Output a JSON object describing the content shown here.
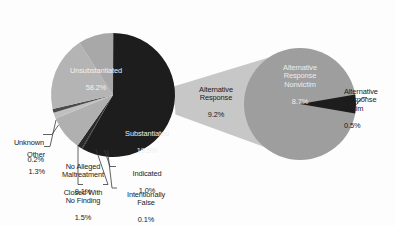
{
  "chart_data": {
    "type": "pie",
    "title": "",
    "subtitle": "",
    "xlabel": "",
    "ylabel": "",
    "legend_position": "none",
    "grid": false,
    "units": "percent",
    "total": 100.0,
    "categories": [
      "Unsubstantiated",
      "Alternative Response",
      "Substantiated",
      "Indicated",
      "Intentionally False",
      "Closed With No Finding",
      "No Alleged Maltreatment",
      "Other",
      "Unknown"
    ],
    "values": [
      58.2,
      9.2,
      19.5,
      1.0,
      0.1,
      1.5,
      9.1,
      1.3,
      0.2
    ],
    "series": [
      {
        "name": "Child maltreatment investigation dispositions",
        "values": [
          58.2,
          9.2,
          19.5,
          1.0,
          0.1,
          1.5,
          9.1,
          1.3,
          0.2
        ]
      }
    ],
    "secondary_pie": {
      "parent_category": "Alternative Response",
      "parent_value": 9.2,
      "categories": [
        "Alternative Response Nonvictim",
        "Alternative Response Victim"
      ],
      "values": [
        8.7,
        0.5
      ]
    }
  },
  "main_pie": {
    "slices": [
      {
        "key": "unsubstantiated",
        "name": "Unsubstantiated",
        "label": "Unsubstantiated",
        "value": "58.2%",
        "pct": 58.2,
        "color": "#1d1d1d",
        "label_placement": "inside"
      },
      {
        "key": "alternative-response",
        "name": "Alternative Response",
        "label": "Alternative Response",
        "value": "9.2%",
        "pct": 9.2,
        "color": "#a8a8a8",
        "label_placement": "callout"
      },
      {
        "key": "substantiated",
        "name": "Substantiated",
        "label": "Substantiated",
        "value": "19.5%",
        "pct": 19.5,
        "color": "#b4b4b4",
        "label_placement": "inside"
      },
      {
        "key": "indicated",
        "name": "Indicated",
        "label": "Indicated",
        "value": "1.0%",
        "pct": 1.0,
        "color": "#4a4a4a",
        "label_placement": "leader"
      },
      {
        "key": "intentionally-false",
        "name": "Intentionally False",
        "label": "Intentionally\nFalse",
        "value": "0.1%",
        "pct": 0.1,
        "color": "#9a9a9a",
        "label_placement": "leader"
      },
      {
        "key": "closed-with-no-finding",
        "name": "Closed With No Finding",
        "label": "Closed With\nNo Finding",
        "value": "1.5%",
        "pct": 1.5,
        "color": "#c0c0c0",
        "label_placement": "leader"
      },
      {
        "key": "no-alleged-maltreatment",
        "name": "No Alleged Maltreatment",
        "label": "No Alleged\nMaltreatment",
        "value": "9.1%",
        "pct": 9.1,
        "color": "#b0b0b0",
        "label_placement": "leader"
      },
      {
        "key": "other",
        "name": "Other",
        "label": "Other",
        "value": "1.3%",
        "pct": 1.3,
        "color": "#2a2a2a",
        "label_placement": "leader"
      },
      {
        "key": "unknown",
        "name": "Unknown",
        "label": "Unknown",
        "value": "0.2%",
        "pct": 0.2,
        "color": "#151515",
        "label_placement": "leader"
      }
    ]
  },
  "detail_pie": {
    "slices": [
      {
        "key": "ar-nonvictim",
        "name": "Alternative Response Nonvictim",
        "label": "Alternative\nResponse\nNonvictim",
        "value": "8.7%",
        "pct": 8.7,
        "color": "#9e9e9e",
        "label_placement": "inside"
      },
      {
        "key": "ar-victim",
        "name": "Alternative Response Victim",
        "label": "Alternative\nResponse\nVictim",
        "value": "0.5%",
        "pct": 0.5,
        "color": "#1d1d1d",
        "label_placement": "outside"
      }
    ]
  },
  "connector": {
    "name": "explode-connector",
    "color": "#c7c7c7",
    "from": "Alternative Response",
    "to": "detail pie"
  },
  "colors": {
    "background": "#fdfdfd",
    "dark": "#1d1d1d",
    "mid_gray": "#a8a8a8",
    "light_gray": "#c0c0c0",
    "text_dark": "#111111",
    "text_light": "#f2f2f2"
  }
}
